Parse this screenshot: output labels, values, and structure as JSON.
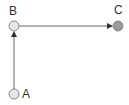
{
  "diagram": {
    "type": "directed-graph",
    "nodes": [
      {
        "id": "A",
        "label": "A",
        "x": 14,
        "y": 94,
        "fill": "#e6e6e6",
        "stroke": "#8a8a8a"
      },
      {
        "id": "B",
        "label": "B",
        "x": 14,
        "y": 26,
        "fill": "#e6e6e6",
        "stroke": "#8a8a8a"
      },
      {
        "id": "C",
        "label": "C",
        "x": 118,
        "y": 26,
        "fill": "#9a9a9a",
        "stroke": "#8a8a8a"
      }
    ],
    "edges": [
      {
        "from": "A",
        "to": "B",
        "color": "#555555"
      },
      {
        "from": "B",
        "to": "C",
        "color": "#555555"
      }
    ]
  }
}
